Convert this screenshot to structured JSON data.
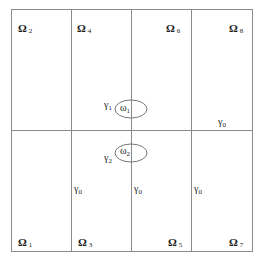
{
  "diagram": {
    "colors": {
      "line": "#8a8a8a",
      "text": "#1a1a1a",
      "background": "#ffffff"
    },
    "grid": {
      "columns": 4,
      "rows": 2,
      "outer_box": {
        "x": 11,
        "y": 9,
        "width": 241,
        "height": 242
      },
      "vertical_dividers_x": [
        71,
        131,
        191
      ],
      "horizontal_divider_y": 130
    },
    "subdomains": [
      {
        "id": "omega-2",
        "symbol": "Ω",
        "index": "2",
        "position": "top-left"
      },
      {
        "id": "omega-4",
        "symbol": "Ω",
        "index": "4",
        "position": "top-second"
      },
      {
        "id": "omega-6",
        "symbol": "Ω",
        "index": "6",
        "position": "top-third"
      },
      {
        "id": "omega-8",
        "symbol": "Ω",
        "index": "8",
        "position": "top-right"
      },
      {
        "id": "omega-1",
        "symbol": "Ω",
        "index": "1",
        "position": "bottom-left"
      },
      {
        "id": "omega-3",
        "symbol": "Ω",
        "index": "3",
        "position": "bottom-second"
      },
      {
        "id": "omega-5",
        "symbol": "Ω",
        "index": "5",
        "position": "bottom-third"
      },
      {
        "id": "omega-7",
        "symbol": "Ω",
        "index": "7",
        "position": "bottom-right"
      }
    ],
    "inclusions": [
      {
        "id": "small-omega-1",
        "symbol": "ω",
        "index": "1",
        "boundary_symbol": "γ",
        "boundary_index": "1",
        "cx": 131,
        "cy": 109,
        "rx": 16,
        "ry": 9
      },
      {
        "id": "small-omega-2",
        "symbol": "ω",
        "index": "2",
        "boundary_symbol": "γ",
        "boundary_index": "2",
        "cx": 131,
        "cy": 153,
        "rx": 16,
        "ry": 9
      }
    ],
    "interface_labels": [
      {
        "id": "gamma0-right-upper",
        "symbol": "γ",
        "index": "0"
      },
      {
        "id": "gamma0-col1",
        "symbol": "γ",
        "index": "0"
      },
      {
        "id": "gamma0-col2",
        "symbol": "γ",
        "index": "0"
      },
      {
        "id": "gamma0-col3",
        "symbol": "γ",
        "index": "0"
      }
    ]
  }
}
